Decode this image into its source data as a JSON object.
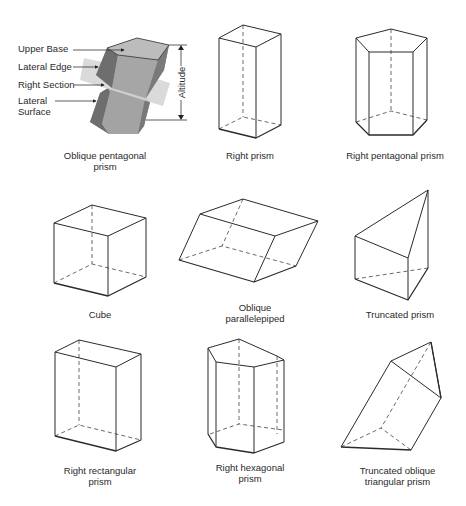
{
  "figures": [
    {
      "id": "oblique-pentagonal-prism",
      "caption": "Oblique pentagonal\nprism",
      "labels": {
        "upper_base": "Upper Base",
        "lateral_edge": "Lateral Edge",
        "right_section": "Right Section",
        "lateral_surface": "Lateral\nSurface",
        "altitude": "Altitude"
      }
    },
    {
      "id": "right-prism",
      "caption": "Right prism"
    },
    {
      "id": "right-pentagonal-prism",
      "caption": "Right pentagonal prism"
    },
    {
      "id": "cube",
      "caption": "Cube"
    },
    {
      "id": "oblique-parallelepiped",
      "caption": "Oblique\nparallelepiped"
    },
    {
      "id": "truncated-prism",
      "caption": "Truncated prism"
    },
    {
      "id": "right-rectangular-prism",
      "caption": "Right rectangular\nprism"
    },
    {
      "id": "right-hexagonal-prism",
      "caption": "Right hexagonal\nprism"
    },
    {
      "id": "truncated-oblique-triangular-prism",
      "caption": "Truncated oblique\ntriangular prism"
    }
  ],
  "colors": {
    "line": "#2b2b2b",
    "face_top": "#b8b8b8",
    "face_front": "#9a9a9a",
    "face_side": "#6e6e6e",
    "section_plane": "#d6d6d6"
  }
}
